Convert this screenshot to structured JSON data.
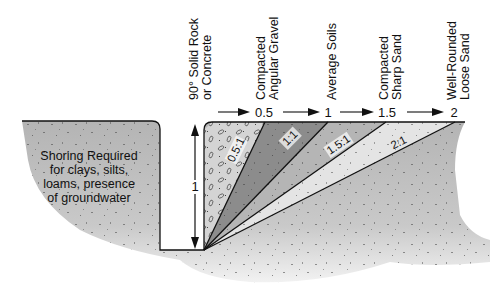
{
  "diagram": {
    "type": "excavation-slope-diagram",
    "vertical_label": "1",
    "left_note": {
      "lines": [
        "Shoring Required",
        "for clays, silts,",
        "loams, presence",
        "of groundwater"
      ]
    },
    "soil_categories": [
      {
        "lines": [
          "90°  Solid Rock",
          "or Concrete"
        ],
        "ratio": "0:1"
      },
      {
        "lines": [
          "Compacted",
          "Angular Gravel"
        ],
        "horizontal": "0.5",
        "ratio": "0.5:1"
      },
      {
        "lines": [
          "Average Soils"
        ],
        "horizontal": "1",
        "ratio": "1:1"
      },
      {
        "lines": [
          "Compacted",
          "Sharp Sand"
        ],
        "horizontal": "1.5",
        "ratio": "1.5:1"
      },
      {
        "lines": [
          "Well-Rounded",
          "Loose Sand"
        ],
        "horizontal": "2",
        "ratio": "2:1"
      }
    ],
    "colors": {
      "ground": "#bdbdbd",
      "gravel_wedge": "#d6d6d6",
      "wedge_1": "#8e8e8e",
      "wedge_15": "#b3b3b3",
      "wedge_2": "#e6e6e6",
      "line": "#111111"
    }
  }
}
